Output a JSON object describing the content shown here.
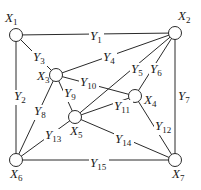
{
  "diagram": {
    "type": "network-graph",
    "nodes": [
      {
        "id": "X1",
        "base": "X",
        "sub": "1",
        "x": 16,
        "y": 35,
        "lx": 5,
        "ly": 22
      },
      {
        "id": "X2",
        "base": "X",
        "sub": "2",
        "x": 175,
        "y": 33,
        "lx": 178,
        "ly": 20
      },
      {
        "id": "X3",
        "base": "X",
        "sub": "3",
        "x": 56,
        "y": 75,
        "lx": 37,
        "ly": 80
      },
      {
        "id": "X4",
        "base": "X",
        "sub": "4",
        "x": 135,
        "y": 96,
        "lx": 144,
        "ly": 104
      },
      {
        "id": "X5",
        "base": "X",
        "sub": "5",
        "x": 75,
        "y": 117,
        "lx": 70,
        "ly": 135
      },
      {
        "id": "X6",
        "base": "X",
        "sub": "6",
        "x": 16,
        "y": 160,
        "lx": 10,
        "ly": 178
      },
      {
        "id": "X7",
        "base": "X",
        "sub": "7",
        "x": 175,
        "y": 160,
        "lx": 172,
        "ly": 178
      }
    ],
    "edges": [
      {
        "id": "Y1",
        "base": "Y",
        "sub": "1",
        "from": "X1",
        "to": "X2",
        "lx": 90,
        "ly": 40
      },
      {
        "id": "Y2",
        "base": "Y",
        "sub": "2",
        "from": "X1",
        "to": "X6",
        "lx": 14,
        "ly": 100
      },
      {
        "id": "Y3",
        "base": "Y",
        "sub": "3",
        "from": "X1",
        "to": "X3",
        "lx": 33,
        "ly": 61
      },
      {
        "id": "Y4",
        "base": "Y",
        "sub": "4",
        "from": "X3",
        "to": "X2",
        "lx": 103,
        "ly": 61
      },
      {
        "id": "Y5",
        "base": "Y",
        "sub": "5",
        "from": "X5",
        "to": "X2",
        "lx": 131,
        "ly": 73
      },
      {
        "id": "Y6",
        "base": "Y",
        "sub": "6",
        "from": "X4",
        "to": "X2",
        "lx": 150,
        "ly": 73
      },
      {
        "id": "Y7",
        "base": "Y",
        "sub": "7",
        "from": "X2",
        "to": "X7",
        "lx": 178,
        "ly": 100
      },
      {
        "id": "Y8",
        "base": "Y",
        "sub": "8",
        "from": "X3",
        "to": "X6",
        "lx": 34,
        "ly": 115
      },
      {
        "id": "Y9",
        "base": "Y",
        "sub": "9",
        "from": "X3",
        "to": "X5",
        "lx": 64,
        "ly": 97
      },
      {
        "id": "Y10",
        "base": "Y",
        "sub": "10",
        "from": "X3",
        "to": "X4",
        "lx": 80,
        "ly": 86
      },
      {
        "id": "Y11",
        "base": "Y",
        "sub": "11",
        "from": "X5",
        "to": "X4",
        "lx": 114,
        "ly": 110
      },
      {
        "id": "Y12",
        "base": "Y",
        "sub": "12",
        "from": "X4",
        "to": "X7",
        "lx": 155,
        "ly": 130
      },
      {
        "id": "Y13",
        "base": "Y",
        "sub": "13",
        "from": "X5",
        "to": "X6",
        "lx": 45,
        "ly": 139
      },
      {
        "id": "Y14",
        "base": "Y",
        "sub": "14",
        "from": "X5",
        "to": "X7",
        "lx": 115,
        "ly": 143
      },
      {
        "id": "Y15",
        "base": "Y",
        "sub": "15",
        "from": "X6",
        "to": "X7",
        "lx": 90,
        "ly": 167
      }
    ],
    "colors": {
      "line": "#2a2a2a",
      "text": "#1a1a1a",
      "background": "#ffffff"
    }
  }
}
